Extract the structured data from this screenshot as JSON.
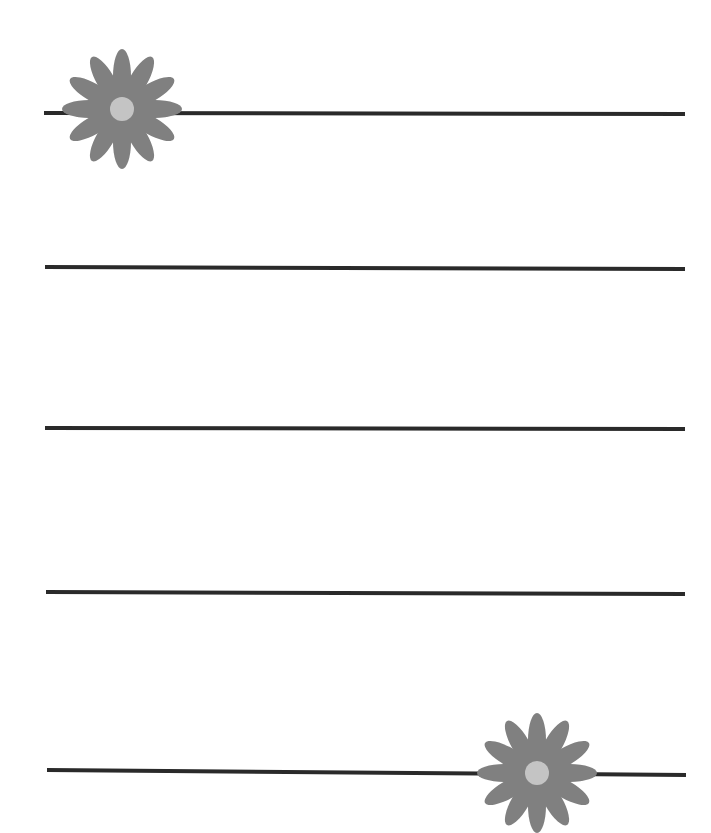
{
  "page": {
    "background": "#ffffff"
  },
  "lines": [
    {
      "x1": 44,
      "y1": 112,
      "x2": 685,
      "y2": 113
    },
    {
      "x1": 45,
      "y1": 266,
      "x2": 685,
      "y2": 268
    },
    {
      "x1": 45,
      "y1": 427,
      "x2": 685,
      "y2": 428
    },
    {
      "x1": 46,
      "y1": 591,
      "x2": 685,
      "y2": 593
    },
    {
      "x1": 47,
      "y1": 769,
      "x2": 686,
      "y2": 774
    }
  ],
  "decorations": [
    {
      "name": "daisy-icon",
      "cx": 122,
      "cy": 109,
      "petal_color": "#808080",
      "center_color": "#c4c4c4"
    },
    {
      "name": "daisy-icon",
      "cx": 537,
      "cy": 773,
      "petal_color": "#808080",
      "center_color": "#c4c4c4"
    }
  ],
  "colors": {
    "line": "#2a2a2a",
    "petal": "#808080",
    "center": "#c4c4c4"
  }
}
